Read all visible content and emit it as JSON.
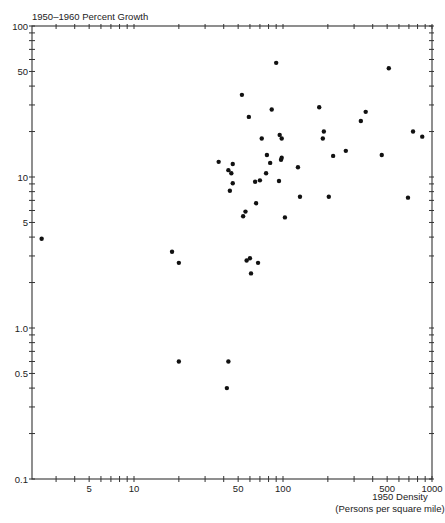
{
  "chart_data": {
    "type": "scatter",
    "title": "1950–1960 Percent Growth",
    "ylabel": "1950–1960 Percent Growth",
    "xlabel": "1950 Density",
    "xlabel_sub": "(Persons per square mile)",
    "xscale": "log",
    "yscale": "log",
    "xlim": [
      2,
      1100
    ],
    "ylim": [
      0.1,
      100
    ],
    "grid": false,
    "legend": null,
    "x_ticks": [
      {
        "value": 5,
        "label": "5"
      },
      {
        "value": 10,
        "label": "10"
      },
      {
        "value": 50,
        "label": "50"
      },
      {
        "value": 100,
        "label": "100"
      },
      {
        "value": 500,
        "label": "500"
      },
      {
        "value": 1000,
        "label": "1000"
      }
    ],
    "y_ticks": [
      {
        "value": 0.1,
        "label": "0.1"
      },
      {
        "value": 0.5,
        "label": "0.5"
      },
      {
        "value": 1,
        "label": "1.0"
      },
      {
        "value": 5,
        "label": "5"
      },
      {
        "value": 10,
        "label": "10"
      },
      {
        "value": 50,
        "label": "50"
      },
      {
        "value": 100,
        "label": "100"
      }
    ],
    "points": [
      {
        "x": 2.4,
        "y": 3.9
      },
      {
        "x": 18,
        "y": 3.2
      },
      {
        "x": 20,
        "y": 2.7
      },
      {
        "x": 20,
        "y": 0.6
      },
      {
        "x": 43,
        "y": 0.6
      },
      {
        "x": 42,
        "y": 0.4
      },
      {
        "x": 37,
        "y": 12.6
      },
      {
        "x": 43,
        "y": 11.1
      },
      {
        "x": 45,
        "y": 10.6
      },
      {
        "x": 46,
        "y": 12.2
      },
      {
        "x": 46,
        "y": 9.1
      },
      {
        "x": 44,
        "y": 8.1
      },
      {
        "x": 53,
        "y": 35
      },
      {
        "x": 59,
        "y": 25
      },
      {
        "x": 56,
        "y": 5.9
      },
      {
        "x": 54,
        "y": 5.5
      },
      {
        "x": 57,
        "y": 2.8
      },
      {
        "x": 60,
        "y": 2.9
      },
      {
        "x": 68,
        "y": 2.7
      },
      {
        "x": 61,
        "y": 2.3
      },
      {
        "x": 65,
        "y": 9.3
      },
      {
        "x": 70,
        "y": 9.5
      },
      {
        "x": 66,
        "y": 6.7
      },
      {
        "x": 72,
        "y": 18
      },
      {
        "x": 78,
        "y": 14
      },
      {
        "x": 82,
        "y": 12.4
      },
      {
        "x": 77,
        "y": 10.6
      },
      {
        "x": 84,
        "y": 28
      },
      {
        "x": 90,
        "y": 57
      },
      {
        "x": 95,
        "y": 19
      },
      {
        "x": 98,
        "y": 18
      },
      {
        "x": 94,
        "y": 9.4
      },
      {
        "x": 97,
        "y": 13
      },
      {
        "x": 98,
        "y": 13.4
      },
      {
        "x": 103,
        "y": 5.4
      },
      {
        "x": 126,
        "y": 11.6
      },
      {
        "x": 130,
        "y": 7.4
      },
      {
        "x": 175,
        "y": 29
      },
      {
        "x": 188,
        "y": 20
      },
      {
        "x": 185,
        "y": 18
      },
      {
        "x": 203,
        "y": 7.4
      },
      {
        "x": 217,
        "y": 13.8
      },
      {
        "x": 264,
        "y": 14.9
      },
      {
        "x": 333,
        "y": 23.5
      },
      {
        "x": 359,
        "y": 27
      },
      {
        "x": 460,
        "y": 14
      },
      {
        "x": 513,
        "y": 52.5
      },
      {
        "x": 690,
        "y": 7.3
      },
      {
        "x": 746,
        "y": 20
      },
      {
        "x": 860,
        "y": 18.5
      }
    ]
  },
  "colors": {
    "axis": "#333333",
    "point": "#111111",
    "background": "#ffffff"
  }
}
